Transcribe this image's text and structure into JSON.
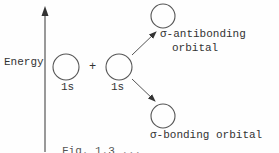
{
  "diagram": {
    "type": "molecular-orbital-diagram",
    "axis": {
      "label": "Energy",
      "direction": "up"
    },
    "atomic_orbitals": [
      {
        "label": "1s"
      },
      {
        "label": "1s"
      }
    ],
    "combine_symbol": "+",
    "molecular_orbitals": {
      "antibonding": {
        "line1": "σ-antibonding",
        "line2": "orbital"
      },
      "bonding": {
        "label": "σ-bonding orbital"
      }
    },
    "caption_partial": "Fig. 1.3 ..."
  },
  "colors": {
    "stroke": "#555555",
    "text": "#333333",
    "background": "#fefefe"
  }
}
